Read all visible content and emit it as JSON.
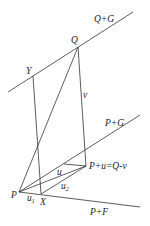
{
  "diagram": {
    "lines": [
      {
        "name": "line-q-plus-g",
        "label": "Q+G",
        "x1": 8,
        "y1": 92,
        "x2": 133,
        "y2": 12
      },
      {
        "name": "line-p-plus-g",
        "label": "P+G",
        "x1": 19,
        "y1": 192,
        "x2": 140,
        "y2": 115
      },
      {
        "name": "line-p-plus-f",
        "label": "P+F",
        "x1": 19,
        "y1": 192,
        "x2": 140,
        "y2": 207
      },
      {
        "name": "segment-y-x",
        "label": "",
        "x1": 33,
        "y1": 76,
        "x2": 41,
        "y2": 194
      },
      {
        "name": "segment-q-pu",
        "label": "v",
        "x1": 78,
        "y1": 47,
        "x2": 86,
        "y2": 166
      },
      {
        "name": "segment-q-p",
        "label": "",
        "x1": 78,
        "y1": 47,
        "x2": 19,
        "y2": 192
      },
      {
        "name": "segment-p-pu",
        "label": "u",
        "x1": 19,
        "y1": 192,
        "x2": 86,
        "y2": 166
      },
      {
        "name": "segment-x-pu",
        "label": "u2",
        "x1": 41,
        "y1": 194,
        "x2": 86,
        "y2": 166
      },
      {
        "name": "segment-g-pu",
        "label": "",
        "x1": 64,
        "y1": 164,
        "x2": 86,
        "y2": 166
      }
    ],
    "labels": {
      "q_plus_g": "Q+G",
      "q": "Q",
      "y": "Y",
      "v": "v",
      "p_plus_g": "P+G",
      "pu": "P+u=Q-v",
      "u": "u",
      "u1_base": "u",
      "u1_sub": "1",
      "u2_base": "u",
      "u2_sub": "2",
      "p": "P",
      "x": "X",
      "p_plus_f": "P+F"
    }
  }
}
